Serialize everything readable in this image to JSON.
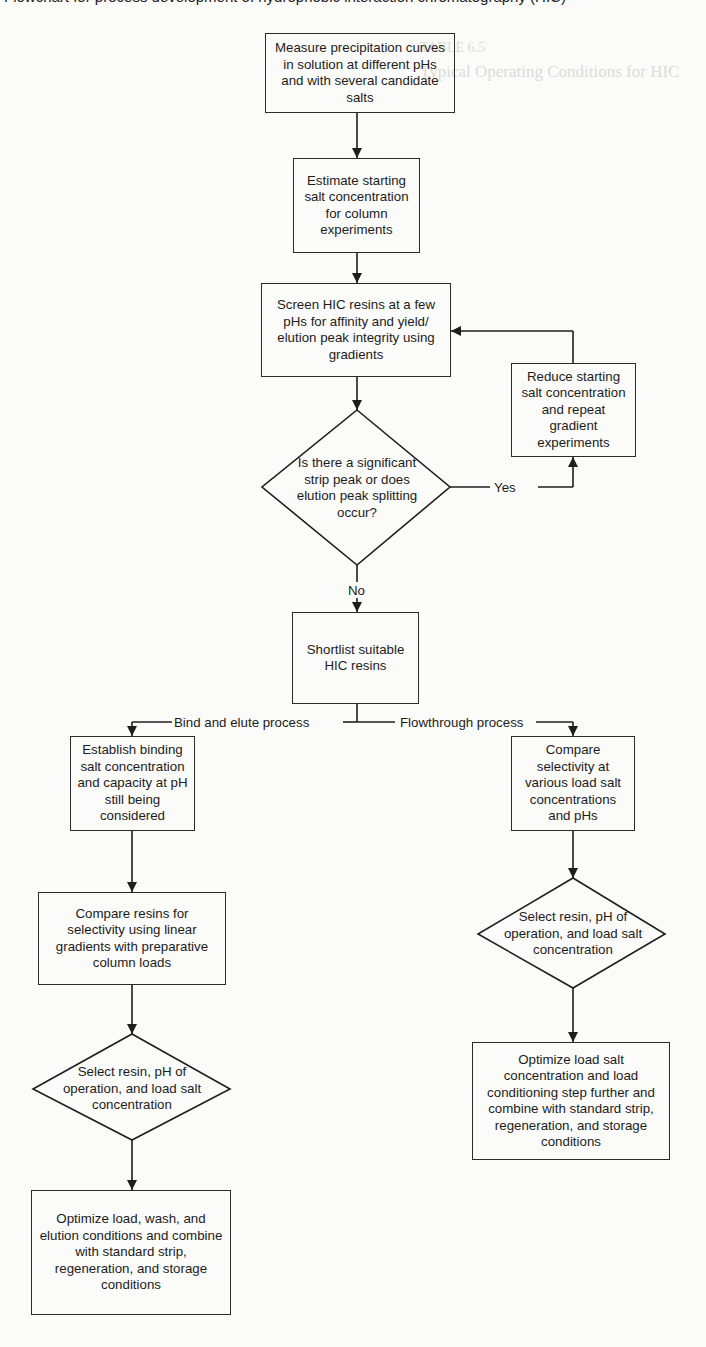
{
  "header": {
    "cutoff_text": "Flowchart for process development of hydrophobic interaction chromatography (HIC)"
  },
  "background_bleed": {
    "lines": [
      "TABLE 6.5",
      "Typical Operating Conditions for HIC"
    ]
  },
  "flowchart": {
    "nodes": {
      "measure": "Measure precipitation curves in solution at different pHs and with several candidate salts",
      "estimate": "Estimate starting salt concentration for column experiments",
      "screen": "Screen HIC resins at a few pHs for affinity and yield/ elution peak integrity using gradients",
      "reduce": "Reduce starting salt concentration and repeat gradient experiments",
      "decision_strip": "Is there a significant strip peak or does elution peak splitting occur?",
      "shortlist": "Shortlist suitable HIC resins",
      "establish": "Establish binding salt concentration and capacity at pH still being considered",
      "compare_resins": "Compare resins for selectivity using linear gradients with preparative column loads",
      "select_left": "Select resin, pH of operation, and load salt concentration",
      "optimize_left": "Optimize load, wash, and elution conditions and combine with standard strip, regeneration, and storage conditions",
      "compare_selectivity": "Compare selectivity at various load salt concentrations and pHs",
      "select_right": "Select resin, pH of operation, and load salt concentration",
      "optimize_right": "Optimize load salt concentration and load conditioning step further and combine with standard strip, regeneration, and storage conditions"
    },
    "edge_labels": {
      "yes": "Yes",
      "no": "No",
      "bind_elute": "Bind and elute process",
      "flowthrough": "Flowthrough process"
    }
  }
}
